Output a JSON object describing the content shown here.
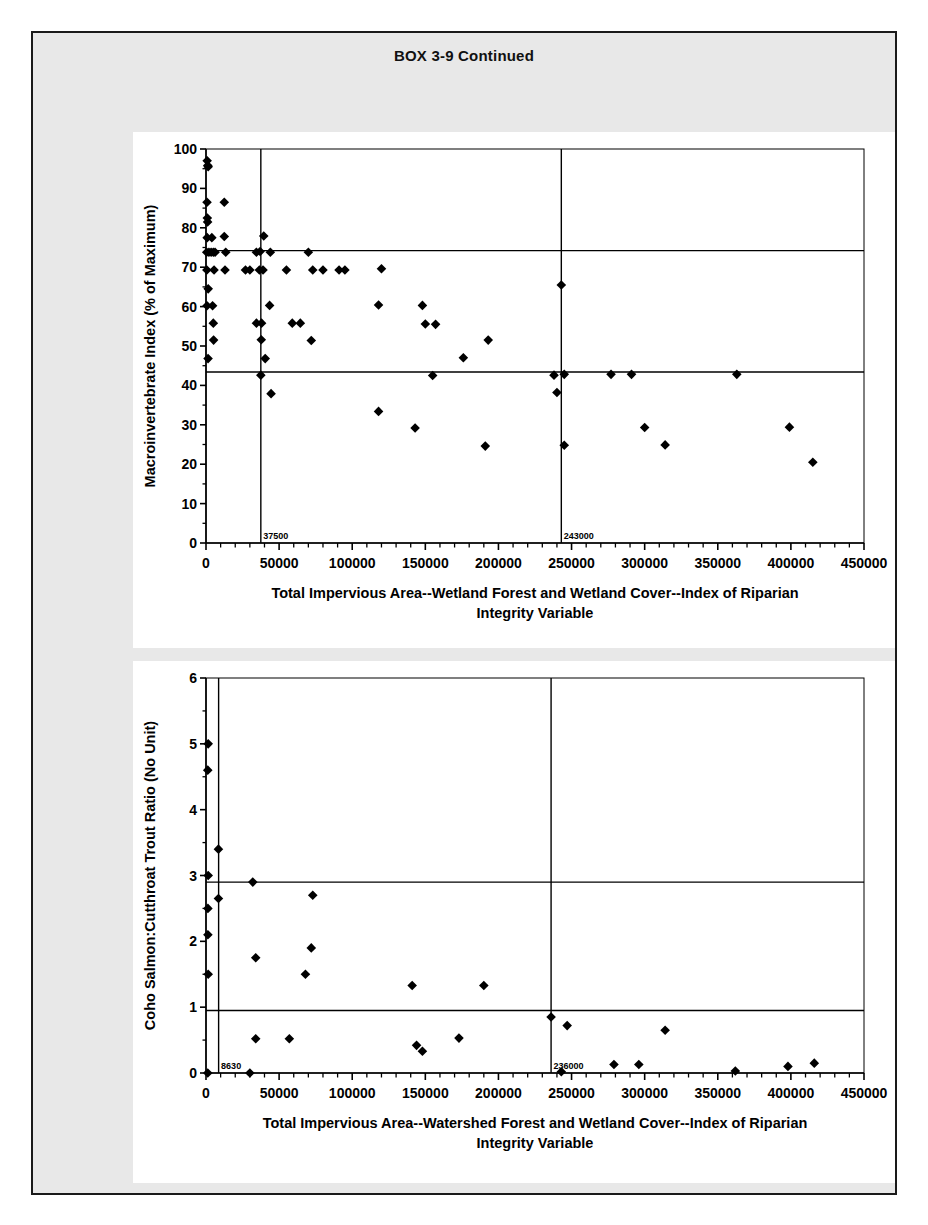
{
  "box": {
    "title": "BOX 3-9 Continued"
  },
  "chart_data": [
    {
      "id": "macroinvertebrate-index",
      "type": "scatter",
      "title": "",
      "xlabel": "Total Impervious Area--Wetland Forest and Wetland Cover--Index of Riparian Integrity Variable",
      "xlabel_line1": "Total Impervious Area--Wetland Forest and Wetland Cover--Index of Riparian",
      "xlabel_line2": "Integrity Variable",
      "ylabel": "Macroinvertebrate Index (% of Maximum)",
      "xlim": [
        0,
        450000
      ],
      "ylim": [
        0,
        100
      ],
      "xticks": [
        0,
        50000,
        100000,
        150000,
        200000,
        250000,
        300000,
        350000,
        400000,
        450000
      ],
      "xtick_labels": [
        "0",
        "50000",
        "100000",
        "150000",
        "200000",
        "250000",
        "300000",
        "350000",
        "400000",
        "450000"
      ],
      "xminor_step": 10000,
      "yticks": [
        0,
        10,
        20,
        30,
        40,
        50,
        60,
        70,
        80,
        90,
        100
      ],
      "ytick_labels": [
        "0",
        "10",
        "20",
        "30",
        "40",
        "50",
        "60",
        "70",
        "80",
        "90",
        "100"
      ],
      "yminor_step": 5,
      "grid": false,
      "marker": "diamond",
      "marker_color": "#000000",
      "vlines": [
        {
          "x": 37500,
          "label": "37500"
        },
        {
          "x": 243000,
          "label": "243000"
        }
      ],
      "hlines": [
        {
          "y": 74.2,
          "label": ""
        },
        {
          "y": 43.4,
          "label": ""
        }
      ],
      "points": [
        [
          800,
          97.0
        ],
        [
          1200,
          95.8
        ],
        [
          1500,
          95.5
        ],
        [
          700,
          86.5
        ],
        [
          12500,
          86.5
        ],
        [
          900,
          82.5
        ],
        [
          1100,
          81.5
        ],
        [
          800,
          77.5
        ],
        [
          4000,
          77.5
        ],
        [
          12500,
          77.8
        ],
        [
          39500,
          77.9
        ],
        [
          500,
          73.8
        ],
        [
          2000,
          73.8
        ],
        [
          3500,
          73.8
        ],
        [
          5000,
          73.8
        ],
        [
          6200,
          73.8
        ],
        [
          13500,
          73.8
        ],
        [
          34500,
          73.8
        ],
        [
          37000,
          74.0
        ],
        [
          44000,
          73.8
        ],
        [
          70000,
          73.8
        ],
        [
          600,
          69.3
        ],
        [
          5500,
          69.3
        ],
        [
          13000,
          69.3
        ],
        [
          27000,
          69.3
        ],
        [
          30000,
          69.3
        ],
        [
          36500,
          69.3
        ],
        [
          39000,
          69.3
        ],
        [
          55000,
          69.3
        ],
        [
          73000,
          69.3
        ],
        [
          80000,
          69.3
        ],
        [
          91000,
          69.3
        ],
        [
          95000,
          69.3
        ],
        [
          120000,
          69.6
        ],
        [
          1500,
          64.5
        ],
        [
          700,
          60.2
        ],
        [
          4500,
          60.2
        ],
        [
          43500,
          60.3
        ],
        [
          118000,
          60.4
        ],
        [
          148000,
          60.3
        ],
        [
          5000,
          55.8
        ],
        [
          34500,
          55.8
        ],
        [
          38000,
          55.8
        ],
        [
          59000,
          55.8
        ],
        [
          64500,
          55.8
        ],
        [
          150000,
          55.6
        ],
        [
          157000,
          55.5
        ],
        [
          5200,
          51.5
        ],
        [
          37800,
          51.6
        ],
        [
          72000,
          51.4
        ],
        [
          193000,
          51.5
        ],
        [
          1400,
          46.8
        ],
        [
          40500,
          46.8
        ],
        [
          176000,
          47.0
        ],
        [
          37500,
          42.6
        ],
        [
          155000,
          42.5
        ],
        [
          238000,
          42.6
        ],
        [
          245000,
          42.8
        ],
        [
          277000,
          42.8
        ],
        [
          291000,
          42.8
        ],
        [
          363000,
          42.8
        ],
        [
          240000,
          38.2
        ],
        [
          44500,
          37.9
        ],
        [
          118000,
          33.4
        ],
        [
          143000,
          29.2
        ],
        [
          300000,
          29.3
        ],
        [
          399000,
          29.4
        ],
        [
          191000,
          24.6
        ],
        [
          245000,
          24.8
        ],
        [
          314000,
          24.9
        ],
        [
          415000,
          20.5
        ],
        [
          243000,
          65.5
        ]
      ]
    },
    {
      "id": "coho-cutthroat-ratio",
      "type": "scatter",
      "title": "",
      "xlabel": "Total Impervious Area--Watershed Forest and Wetland Cover--Index of Riparian Integrity Variable",
      "xlabel_line1": "Total Impervious Area--Watershed Forest and Wetland Cover--Index of Riparian",
      "xlabel_line2": "Integrity Variable",
      "ylabel": "Coho Salmon:Cutthroat Trout Ratio (No Unit)",
      "xlim": [
        0,
        450000
      ],
      "ylim": [
        0,
        6
      ],
      "xticks": [
        0,
        50000,
        100000,
        150000,
        200000,
        250000,
        300000,
        350000,
        400000,
        450000
      ],
      "xtick_labels": [
        "0",
        "50000",
        "100000",
        "150000",
        "200000",
        "250000",
        "300000",
        "350000",
        "400000",
        "450000"
      ],
      "xminor_step": 10000,
      "yticks": [
        0,
        1,
        2,
        3,
        4,
        5,
        6
      ],
      "ytick_labels": [
        "0",
        "1",
        "2",
        "3",
        "4",
        "5",
        "6"
      ],
      "yminor_step": 0.5,
      "grid": false,
      "marker": "diamond",
      "marker_color": "#000000",
      "vlines": [
        {
          "x": 8630,
          "label": "8630"
        },
        {
          "x": 236000,
          "label": "236000"
        }
      ],
      "hlines": [
        {
          "y": 2.9,
          "label": ""
        },
        {
          "y": 0.95,
          "label": ""
        }
      ],
      "points": [
        [
          1500,
          5.0
        ],
        [
          1200,
          4.6
        ],
        [
          8500,
          3.4
        ],
        [
          1500,
          3.0
        ],
        [
          32000,
          2.9
        ],
        [
          8500,
          2.65
        ],
        [
          1300,
          2.5
        ],
        [
          1300,
          2.1
        ],
        [
          73000,
          2.7
        ],
        [
          72000,
          1.9
        ],
        [
          34000,
          1.75
        ],
        [
          68000,
          1.5
        ],
        [
          1500,
          1.5
        ],
        [
          141000,
          1.33
        ],
        [
          190000,
          1.33
        ],
        [
          236000,
          0.85
        ],
        [
          247000,
          0.72
        ],
        [
          314000,
          0.65
        ],
        [
          34000,
          0.52
        ],
        [
          57000,
          0.52
        ],
        [
          173000,
          0.53
        ],
        [
          144000,
          0.42
        ],
        [
          148000,
          0.33
        ],
        [
          279000,
          0.13
        ],
        [
          296000,
          0.13
        ],
        [
          398000,
          0.1
        ],
        [
          416000,
          0.15
        ],
        [
          1200,
          0.0
        ],
        [
          30000,
          0.0
        ],
        [
          243000,
          0.02
        ],
        [
          362000,
          0.03
        ]
      ]
    }
  ]
}
